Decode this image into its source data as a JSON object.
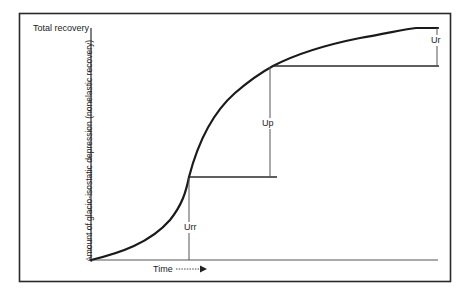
{
  "diagram": {
    "type": "glacio-isostatic recovery curve",
    "y_axis": {
      "top_label": "Total recovery",
      "label": "Amount of glacio-isostatic depression (nonelastic recovery)"
    },
    "x_axis": {
      "label": "Time",
      "arrow": "dashed-arrow-right"
    },
    "segments": [
      {
        "id": "urr",
        "label": "Urr"
      },
      {
        "id": "up",
        "label": "Up"
      },
      {
        "id": "ur",
        "label": "Ur"
      }
    ],
    "colors": {
      "line": "#1a1a1a",
      "frame": "#2a2a2a",
      "background": "#ffffff"
    }
  }
}
